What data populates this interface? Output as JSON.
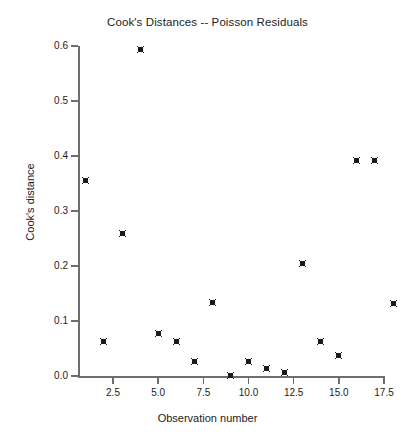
{
  "chart_data": {
    "type": "scatter",
    "title": "Cook's Distances -- Poisson Residuals",
    "xlabel": "Observation number",
    "ylabel": "Cook's distance",
    "grid": false,
    "legend": null,
    "marker": "filled-square",
    "marker_color": "#1a1a1a",
    "xlim": [
      0.4,
      18.6
    ],
    "ylim": [
      0.0,
      0.6
    ],
    "xticks": [
      2.5,
      5.0,
      7.5,
      10.0,
      12.5,
      15.0,
      17.5
    ],
    "xtick_labels": [
      "2.5",
      "5.0",
      "7.5",
      "10.0",
      "12.5",
      "15.0",
      "17.5"
    ],
    "yticks": [
      0.0,
      0.1,
      0.2,
      0.3,
      0.4,
      0.5,
      0.6
    ],
    "ytick_labels": [
      "0.0",
      "0.1",
      "0.2",
      "0.3",
      "0.4",
      "0.5",
      "0.6"
    ],
    "x": [
      1,
      2,
      3,
      4,
      5,
      6,
      7,
      8,
      9,
      10,
      11,
      12,
      13,
      14,
      15,
      16,
      17,
      18
    ],
    "y": [
      0.356,
      0.062,
      0.26,
      0.594,
      0.078,
      0.062,
      0.026,
      0.133,
      0.001,
      0.027,
      0.013,
      0.006,
      0.204,
      0.062,
      0.037,
      0.392,
      0.392,
      0.132
    ],
    "points": [
      {
        "x": 1,
        "y": 0.356
      },
      {
        "x": 2,
        "y": 0.062
      },
      {
        "x": 3,
        "y": 0.26
      },
      {
        "x": 4,
        "y": 0.594
      },
      {
        "x": 5,
        "y": 0.078
      },
      {
        "x": 6,
        "y": 0.062
      },
      {
        "x": 7,
        "y": 0.026
      },
      {
        "x": 8,
        "y": 0.133
      },
      {
        "x": 9,
        "y": 0.001
      },
      {
        "x": 10,
        "y": 0.027
      },
      {
        "x": 11,
        "y": 0.013
      },
      {
        "x": 12,
        "y": 0.006
      },
      {
        "x": 13,
        "y": 0.204
      },
      {
        "x": 14,
        "y": 0.062
      },
      {
        "x": 15,
        "y": 0.037
      },
      {
        "x": 16,
        "y": 0.392
      },
      {
        "x": 17,
        "y": 0.392
      },
      {
        "x": 18,
        "y": 0.132
      }
    ]
  }
}
